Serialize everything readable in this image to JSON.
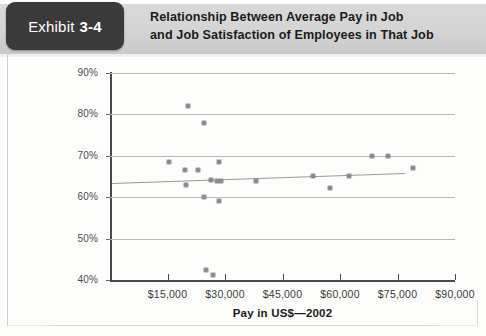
{
  "exhibit": {
    "label": "Exhibit",
    "number": "3-4",
    "title_line1": "Relationship Between Average Pay in Job",
    "title_line2": "and Job Satisfaction of Employees in That Job"
  },
  "colors": {
    "tab_background": "#3a3a3a",
    "band_background": "#d4d4d4",
    "point": "#8a8a8e",
    "gridline": "#b9b9b9",
    "axis": "#4a4a4a",
    "trendline": "#9a9a9a"
  },
  "chart_data": {
    "type": "scatter",
    "title": "Relationship Between Average Pay in Job and Job Satisfaction of Employees in That Job",
    "xlabel": "Pay in US$—2002",
    "ylabel": "Percentage of Pay Satisfaction",
    "xlim": [
      0,
      90000
    ],
    "ylim": [
      40,
      90
    ],
    "xticks": [
      15000,
      30000,
      45000,
      60000,
      75000,
      90000
    ],
    "xtick_labels": [
      "$15,000",
      "$30,000",
      "$45,000",
      "$60,000",
      "$75,000",
      "$90,000"
    ],
    "yticks": [
      40,
      50,
      60,
      70,
      80,
      90
    ],
    "ytick_labels": [
      "40%",
      "50%",
      "60%",
      "70%",
      "80%",
      "90%"
    ],
    "grid": true,
    "legend": "none",
    "points": [
      {
        "x": 20500,
        "y": 82.0
      },
      {
        "x": 24500,
        "y": 78.0
      },
      {
        "x": 15500,
        "y": 68.5
      },
      {
        "x": 19500,
        "y": 66.5
      },
      {
        "x": 23000,
        "y": 66.5
      },
      {
        "x": 28500,
        "y": 68.5
      },
      {
        "x": 19800,
        "y": 63.0
      },
      {
        "x": 26500,
        "y": 64.2
      },
      {
        "x": 28000,
        "y": 63.8
      },
      {
        "x": 29000,
        "y": 63.9
      },
      {
        "x": 24500,
        "y": 60.0
      },
      {
        "x": 28500,
        "y": 59.0
      },
      {
        "x": 38000,
        "y": 63.8
      },
      {
        "x": 53000,
        "y": 65.0
      },
      {
        "x": 57500,
        "y": 62.3
      },
      {
        "x": 62500,
        "y": 65.2
      },
      {
        "x": 68500,
        "y": 70.0
      },
      {
        "x": 72500,
        "y": 70.0
      },
      {
        "x": 79000,
        "y": 67.0
      },
      {
        "x": 25000,
        "y": 42.3
      },
      {
        "x": 26800,
        "y": 41.2
      }
    ],
    "trendline": {
      "x_start": 500,
      "y_start": 63.4,
      "x_end": 77000,
      "y_end": 65.8
    }
  }
}
